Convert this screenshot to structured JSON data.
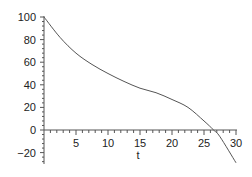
{
  "chart_data": {
    "type": "line",
    "title": "",
    "xlabel": "t",
    "ylabel": "",
    "xlim": [
      0,
      30
    ],
    "ylim": [
      -30,
      100
    ],
    "x_ticks": [
      5,
      10,
      15,
      20,
      25,
      30
    ],
    "y_ticks": [
      -20,
      0,
      20,
      40,
      60,
      80,
      100
    ],
    "grid": false,
    "series": [
      {
        "name": "f(t)",
        "x": [
          0,
          2.5,
          5,
          7.5,
          10,
          12.5,
          15,
          17.5,
          20,
          22.5,
          25,
          26.5,
          27.5,
          30
        ],
        "values": [
          100,
          82,
          68,
          58,
          50,
          43,
          37,
          33,
          27,
          20,
          8,
          0,
          -6,
          -29
        ]
      }
    ]
  }
}
